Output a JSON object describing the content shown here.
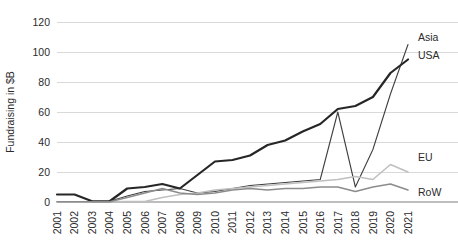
{
  "chart_data": {
    "type": "line",
    "title": "",
    "xlabel": "",
    "ylabel": "Fundraising in $B",
    "ylim": [
      0,
      120
    ],
    "yticks": [
      0,
      20,
      40,
      60,
      80,
      100,
      120
    ],
    "grid": true,
    "legend_position": "end-of-line labels",
    "categories": [
      "2001",
      "2002",
      "2003",
      "2004",
      "2005",
      "2006",
      "2007",
      "2008",
      "2009",
      "2010",
      "2011",
      "2012",
      "2013",
      "2014",
      "2015",
      "2016",
      "2017",
      "2018",
      "2019",
      "2020",
      "2021"
    ],
    "series": [
      {
        "name": "Asia",
        "color": "#3f3f3f",
        "stroke_width": 1.1,
        "values": [
          0.3,
          0.3,
          0.3,
          0.5,
          4.0,
          7.0,
          8.0,
          9.0,
          6.0,
          7.0,
          9.0,
          11.0,
          12.0,
          13.0,
          14.0,
          15.0,
          60.0,
          10.0,
          35.0,
          72.0,
          105.0
        ]
      },
      {
        "name": "USA",
        "color": "#262626",
        "stroke_width": 2.2,
        "values": [
          5.0,
          5.0,
          0.5,
          0.5,
          9.0,
          10.0,
          12.0,
          9.0,
          18.0,
          27.0,
          28.0,
          31.0,
          38.0,
          41.0,
          47.0,
          52.0,
          62.0,
          64.0,
          70.0,
          86.0,
          95.0
        ]
      },
      {
        "name": "EU",
        "color": "#bfbfbf",
        "stroke_width": 1.6,
        "values": [
          0.2,
          0.2,
          0.2,
          0.2,
          0.3,
          0.3,
          3.0,
          5.0,
          6.0,
          8.0,
          9.0,
          10.0,
          11.0,
          12.0,
          13.0,
          14.0,
          15.0,
          17.0,
          15.0,
          25.0,
          20.0
        ]
      },
      {
        "name": "RoW",
        "color": "#8c8c8c",
        "stroke_width": 1.6,
        "values": [
          0.2,
          0.2,
          0.2,
          0.2,
          3.0,
          6.0,
          9.0,
          6.0,
          5.0,
          6.0,
          8.0,
          9.0,
          8.0,
          9.0,
          9.0,
          10.0,
          10.0,
          7.0,
          10.0,
          12.0,
          8.0
        ]
      }
    ],
    "series_end_labels": [
      {
        "name": "Asia"
      },
      {
        "name": "USA"
      },
      {
        "name": "EU"
      },
      {
        "name": "RoW"
      }
    ]
  }
}
